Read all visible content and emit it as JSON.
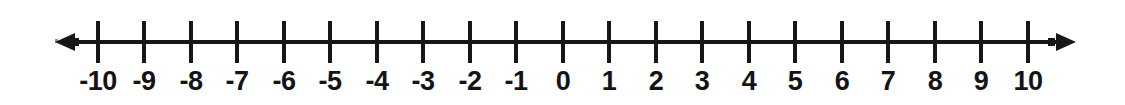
{
  "figure": {
    "background_color": "#ffffff",
    "ink_color": "#17171a"
  },
  "chart_data": {
    "type": "number-line",
    "title": "",
    "xlabel": "",
    "ylabel": "",
    "xlim": [
      -10,
      10
    ],
    "tick_step": 1,
    "grid": false,
    "legend": null,
    "arrowheads": [
      "left",
      "right"
    ],
    "ticks": [
      {
        "value": -10,
        "label": "-10",
        "x": 98
      },
      {
        "value": -9,
        "label": "-9",
        "x": 144
      },
      {
        "value": -8,
        "label": "-8",
        "x": 191
      },
      {
        "value": -7,
        "label": "-7",
        "x": 237
      },
      {
        "value": -6,
        "label": "-6",
        "x": 284
      },
      {
        "value": -5,
        "label": "-5",
        "x": 330
      },
      {
        "value": -4,
        "label": "-4",
        "x": 377
      },
      {
        "value": -3,
        "label": "-3",
        "x": 423
      },
      {
        "value": -2,
        "label": "-2",
        "x": 470
      },
      {
        "value": -1,
        "label": "-1",
        "x": 516
      },
      {
        "value": 0,
        "label": "0",
        "x": 563
      },
      {
        "value": 1,
        "label": "1",
        "x": 609
      },
      {
        "value": 2,
        "label": "2",
        "x": 656
      },
      {
        "value": 3,
        "label": "3",
        "x": 702
      },
      {
        "value": 4,
        "label": "4",
        "x": 749
      },
      {
        "value": 5,
        "label": "5",
        "x": 795
      },
      {
        "value": 6,
        "label": "6",
        "x": 842
      },
      {
        "value": 7,
        "label": "7",
        "x": 888
      },
      {
        "value": 8,
        "label": "8",
        "x": 935
      },
      {
        "value": 9,
        "label": "9",
        "x": 981
      },
      {
        "value": 10,
        "label": "10",
        "x": 1028
      }
    ],
    "marked_points": [],
    "annotations": []
  }
}
